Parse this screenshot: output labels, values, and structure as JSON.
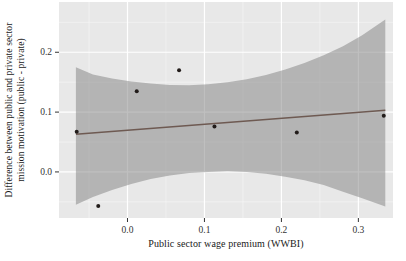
{
  "figure": {
    "y_axis_label_line1": "Difference between public and private sector",
    "y_axis_label_line2": "mission motivation (public - private)",
    "x_axis_label": "Public sector wage premium (WWBI)"
  },
  "colors": {
    "panel_background": "#e8e8e8",
    "grid_major": "#ffffff",
    "grid_minor": "#f5f5f5",
    "confidence_band": "#808080",
    "confidence_band_opacity": 0.5,
    "regression_line": "#6e5a52",
    "point": "#221c1a",
    "tick_mark": "#333333",
    "tick_text": "#333333"
  },
  "chart_data": {
    "type": "scatter",
    "title": "",
    "xlabel": "Public sector wage premium (WWBI)",
    "ylabel": "Difference between public and private sector mission motivation (public - private)",
    "xlim": [
      -0.089,
      0.345
    ],
    "ylim": [
      -0.077,
      0.284
    ],
    "grid": true,
    "legend": false,
    "x_ticks": [
      0.0,
      0.1,
      0.2,
      0.3
    ],
    "x_tick_labels": [
      "0.0",
      "0.1",
      "0.2",
      "0.3"
    ],
    "x_minor_ticks": [
      -0.05,
      0.05,
      0.15,
      0.25
    ],
    "y_ticks": [
      0.0,
      0.1,
      0.2
    ],
    "y_tick_labels": [
      "0.0",
      "0.1",
      "0.2"
    ],
    "y_minor_ticks": [
      -0.05,
      0.05,
      0.15,
      0.25
    ],
    "points": [
      {
        "x": -0.066,
        "y": 0.067
      },
      {
        "x": -0.038,
        "y": -0.057
      },
      {
        "x": 0.012,
        "y": 0.135
      },
      {
        "x": 0.067,
        "y": 0.17
      },
      {
        "x": 0.113,
        "y": 0.076
      },
      {
        "x": 0.22,
        "y": 0.066
      },
      {
        "x": 0.333,
        "y": 0.094
      }
    ],
    "regression_line": {
      "x1": -0.067,
      "y1": 0.063,
      "x2": 0.335,
      "y2": 0.103
    },
    "confidence_band": {
      "upper": [
        [
          -0.067,
          0.175
        ],
        [
          -0.045,
          0.163
        ],
        [
          -0.02,
          0.156
        ],
        [
          0.005,
          0.151
        ],
        [
          0.03,
          0.148
        ],
        [
          0.055,
          0.1455
        ],
        [
          0.08,
          0.145
        ],
        [
          0.105,
          0.1465
        ],
        [
          0.13,
          0.15
        ],
        [
          0.155,
          0.155
        ],
        [
          0.18,
          0.162
        ],
        [
          0.205,
          0.171
        ],
        [
          0.23,
          0.182
        ],
        [
          0.255,
          0.195
        ],
        [
          0.28,
          0.21
        ],
        [
          0.305,
          0.2285
        ],
        [
          0.335,
          0.255
        ]
      ],
      "lower": [
        [
          -0.067,
          -0.055
        ],
        [
          -0.045,
          -0.042
        ],
        [
          -0.02,
          -0.03
        ],
        [
          0.005,
          -0.02
        ],
        [
          0.03,
          -0.012
        ],
        [
          0.055,
          -0.006
        ],
        [
          0.08,
          -0.002
        ],
        [
          0.105,
          0.0
        ],
        [
          0.13,
          0.001
        ],
        [
          0.155,
          0.0
        ],
        [
          0.18,
          -0.003
        ],
        [
          0.205,
          -0.008
        ],
        [
          0.23,
          -0.014
        ],
        [
          0.255,
          -0.022
        ],
        [
          0.28,
          -0.033
        ],
        [
          0.305,
          -0.044
        ],
        [
          0.335,
          -0.058
        ]
      ]
    }
  }
}
